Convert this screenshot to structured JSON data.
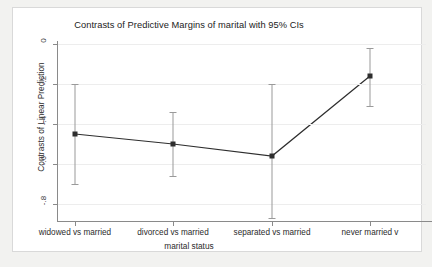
{
  "chart_data": {
    "type": "line",
    "title": "Contrasts of Predictive Margins of marital with 95% CIs",
    "xlabel": "marital status",
    "ylabel": "Contrasts of Linear Prediction",
    "categories": [
      "widowed vs married",
      "divorced vs married",
      "separated vs married",
      "never married v"
    ],
    "values": [
      -0.45,
      -0.5,
      -0.56,
      -0.16
    ],
    "ci_low": [
      -0.7,
      -0.66,
      -0.87,
      -0.31
    ],
    "ci_high": [
      -0.2,
      -0.34,
      -0.2,
      -0.02
    ],
    "ylim": [
      -0.88,
      0.02
    ],
    "yticks": [
      0,
      -0.2,
      -0.4,
      -0.6,
      -0.8
    ],
    "ytick_labels": [
      "0",
      "-.2",
      "-.4",
      "-.6",
      "-.8"
    ],
    "grid": true,
    "legend": "none",
    "marker": "square",
    "series_color": "#2e2e2e",
    "ci_color": "#9a9a9a",
    "grid_color": "#ededed",
    "axis_color": "#8a8a8a",
    "panel_background": "#ffffff",
    "page_background": "#f2f2f0",
    "note_last_label_truncated": true
  }
}
